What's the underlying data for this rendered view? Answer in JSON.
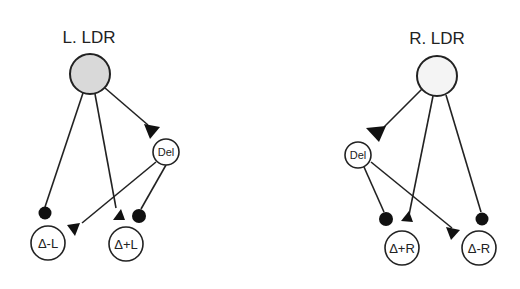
{
  "diagram": {
    "left": {
      "title": "L. LDR",
      "source_node": {
        "label": "",
        "fill": "#d9d9d9"
      },
      "del_node": {
        "label": "Del"
      },
      "out_nodes": [
        {
          "label": "Δ-L"
        },
        {
          "label": "Δ+L"
        }
      ]
    },
    "right": {
      "title": "R. LDR",
      "source_node": {
        "label": "",
        "fill": "#f4f4f4"
      },
      "del_node": {
        "label": "Del"
      },
      "out_nodes": [
        {
          "label": "Δ+R"
        },
        {
          "label": "Δ-R"
        }
      ]
    },
    "legend_semantics": {
      "triangle": "excitatory",
      "dot": "inhibitory"
    },
    "colors": {
      "stroke": "#222222",
      "left_fill": "#d9d9d9",
      "right_fill": "#f4f4f4"
    }
  }
}
